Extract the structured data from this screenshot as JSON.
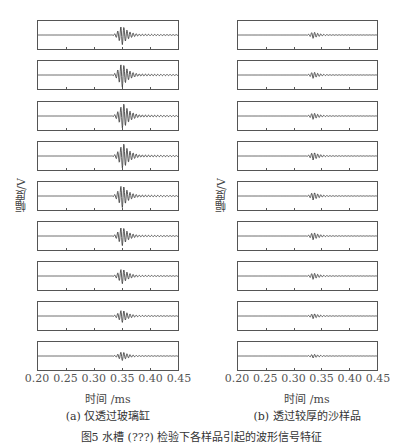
{
  "chart_data": [
    {
      "type": "line",
      "title": "",
      "subcaption": "(a) 仅透过玻璃缸",
      "xlabel": "时间 /ms",
      "ylabel": "幅度/V",
      "xlim": [
        0.2,
        0.45
      ],
      "xticks": [
        "0.20",
        "0.25",
        "0.30",
        "0.35",
        "0.40",
        "0.45"
      ],
      "grid": false,
      "stacked_traces": 9,
      "series": [
        {
          "name": "trace-1",
          "onset_ms": 0.33,
          "peak_ms": 0.35,
          "relative_amplitude": 0.75
        },
        {
          "name": "trace-2",
          "onset_ms": 0.33,
          "peak_ms": 0.35,
          "relative_amplitude": 0.95
        },
        {
          "name": "trace-3",
          "onset_ms": 0.33,
          "peak_ms": 0.352,
          "relative_amplitude": 1.0
        },
        {
          "name": "trace-4",
          "onset_ms": 0.33,
          "peak_ms": 0.352,
          "relative_amplitude": 1.0
        },
        {
          "name": "trace-5",
          "onset_ms": 0.33,
          "peak_ms": 0.35,
          "relative_amplitude": 0.9
        },
        {
          "name": "trace-6",
          "onset_ms": 0.33,
          "peak_ms": 0.35,
          "relative_amplitude": 0.75
        },
        {
          "name": "trace-7",
          "onset_ms": 0.33,
          "peak_ms": 0.35,
          "relative_amplitude": 0.6
        },
        {
          "name": "trace-8",
          "onset_ms": 0.33,
          "peak_ms": 0.35,
          "relative_amplitude": 0.5
        },
        {
          "name": "trace-9",
          "onset_ms": 0.33,
          "peak_ms": 0.35,
          "relative_amplitude": 0.35
        }
      ]
    },
    {
      "type": "line",
      "title": "",
      "subcaption": "(b) 透过较厚的沙样品",
      "xlabel": "时间 /ms",
      "ylabel": "幅度/V",
      "xlim": [
        0.2,
        0.45
      ],
      "xticks": [
        "0.20",
        "0.25",
        "0.30",
        "0.35",
        "0.40",
        "0.45"
      ],
      "grid": false,
      "stacked_traces": 9,
      "series": [
        {
          "name": "trace-1",
          "onset_ms": 0.32,
          "peak_ms": 0.335,
          "relative_amplitude": 0.25
        },
        {
          "name": "trace-2",
          "onset_ms": 0.32,
          "peak_ms": 0.335,
          "relative_amplitude": 0.25
        },
        {
          "name": "trace-3",
          "onset_ms": 0.32,
          "peak_ms": 0.335,
          "relative_amplitude": 0.25
        },
        {
          "name": "trace-4",
          "onset_ms": 0.32,
          "peak_ms": 0.335,
          "relative_amplitude": 0.3
        },
        {
          "name": "trace-5",
          "onset_ms": 0.32,
          "peak_ms": 0.335,
          "relative_amplitude": 0.3
        },
        {
          "name": "trace-6",
          "onset_ms": 0.32,
          "peak_ms": 0.335,
          "relative_amplitude": 0.28
        },
        {
          "name": "trace-7",
          "onset_ms": 0.32,
          "peak_ms": 0.335,
          "relative_amplitude": 0.25
        },
        {
          "name": "trace-8",
          "onset_ms": 0.32,
          "peak_ms": 0.335,
          "relative_amplitude": 0.2
        },
        {
          "name": "trace-9",
          "onset_ms": 0.32,
          "peak_ms": 0.335,
          "relative_amplitude": 0.15
        }
      ]
    }
  ],
  "figure_caption": "图5  水槽 (???) 检验下各样品引起的波形信号特征",
  "colors": {
    "trace": "#333333",
    "axis": "#555555"
  }
}
